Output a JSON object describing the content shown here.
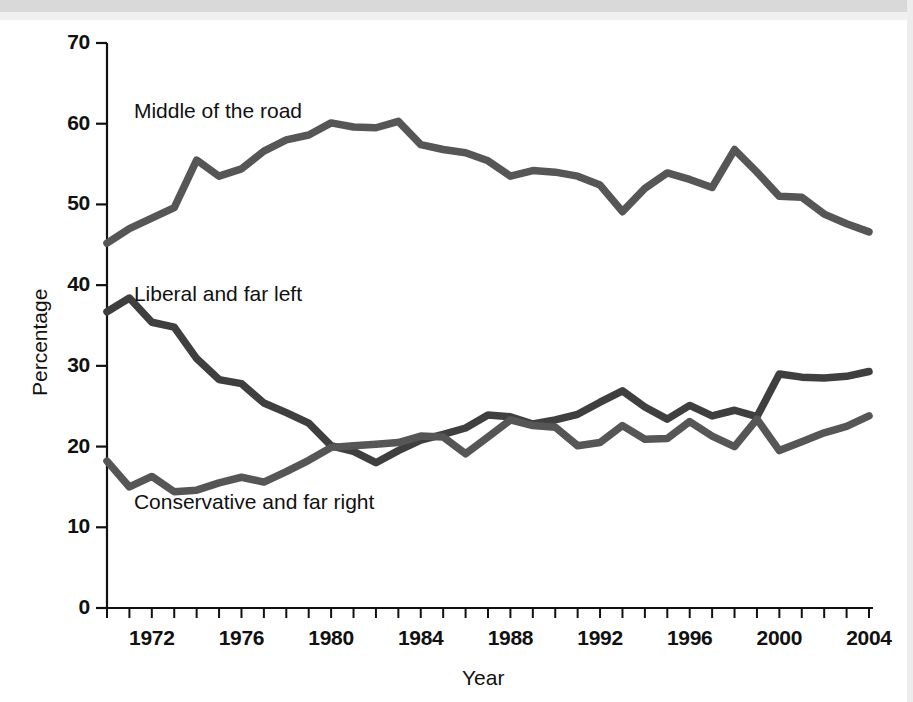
{
  "chart_data": {
    "type": "line",
    "title": "",
    "xlabel": "Year",
    "ylabel": "Percentage",
    "xlim": [
      1970,
      2004
    ],
    "ylim": [
      0,
      70
    ],
    "grid": false,
    "legend_position": "inline-annotations",
    "x_tick_labels": [
      "1972",
      "1976",
      "1980",
      "1984",
      "1988",
      "1992",
      "1996",
      "2000",
      "2004"
    ],
    "x_tick_values": [
      1972,
      1976,
      1980,
      1984,
      1988,
      1992,
      1996,
      2000,
      2004
    ],
    "x_minor_tick_values": [
      1970,
      1971,
      1972,
      1973,
      1974,
      1975,
      1976,
      1977,
      1978,
      1979,
      1980,
      1981,
      1982,
      1983,
      1984,
      1985,
      1986,
      1987,
      1988,
      1989,
      1990,
      1991,
      1992,
      1993,
      1994,
      1995,
      1996,
      1997,
      1998,
      1999,
      2000,
      2001,
      2002,
      2003,
      2004
    ],
    "y_tick_labels": [
      "0",
      "10",
      "20",
      "30",
      "40",
      "50",
      "60",
      "70"
    ],
    "y_tick_values": [
      0,
      10,
      20,
      30,
      40,
      50,
      60,
      70
    ],
    "x": [
      1970,
      1971,
      1972,
      1973,
      1974,
      1975,
      1976,
      1977,
      1978,
      1979,
      1980,
      1981,
      1982,
      1983,
      1984,
      1985,
      1986,
      1987,
      1988,
      1989,
      1990,
      1991,
      1992,
      1993,
      1994,
      1995,
      1996,
      1997,
      1998,
      1999,
      2000,
      2001,
      2002,
      2003,
      2004
    ],
    "series": [
      {
        "name": "Middle of the road",
        "label": "Middle of the road",
        "color": "#565656",
        "values": [
          45.2,
          47.0,
          48.3,
          49.6,
          55.5,
          53.5,
          54.4,
          56.6,
          58.0,
          58.6,
          60.1,
          59.6,
          59.5,
          60.3,
          57.4,
          56.8,
          56.4,
          55.4,
          53.5,
          54.2,
          54.0,
          53.5,
          52.4,
          49.1,
          52.0,
          53.9,
          53.1,
          52.1,
          56.8,
          54.0,
          51.0,
          50.9,
          48.8,
          47.6,
          46.6
        ]
      },
      {
        "name": "Liberal and far left",
        "label": "Liberal and far left",
        "color": "#3f3f3f",
        "values": [
          36.7,
          38.4,
          35.4,
          34.8,
          30.9,
          28.3,
          27.8,
          25.4,
          24.2,
          22.9,
          20.1,
          19.4,
          18.0,
          19.5,
          20.8,
          21.5,
          22.3,
          23.9,
          23.7,
          22.8,
          23.3,
          24.0,
          25.5,
          26.9,
          24.9,
          23.4,
          25.1,
          23.8,
          24.5,
          23.7,
          29.0,
          28.6,
          28.5,
          28.7,
          29.3
        ]
      },
      {
        "name": "Conservative and far right",
        "label": "Conservative and far right",
        "color": "#565656",
        "values": [
          18.2,
          15.0,
          16.3,
          14.4,
          14.6,
          15.5,
          16.2,
          15.6,
          16.9,
          18.3,
          19.9,
          20.1,
          20.3,
          20.5,
          21.3,
          21.2,
          19.1,
          21.2,
          23.3,
          22.6,
          22.4,
          20.1,
          20.5,
          22.6,
          20.9,
          21.0,
          23.1,
          21.3,
          20.0,
          23.4,
          19.5,
          20.6,
          21.7,
          22.5,
          23.8
        ]
      }
    ],
    "annotations": [
      {
        "text": "Middle of the road",
        "x": 1971.2,
        "y": 61.5
      },
      {
        "text": "Liberal and far left",
        "x": 1971.2,
        "y": 38.8
      },
      {
        "text": "Conservative and far right",
        "x": 1971.2,
        "y": 13.0
      }
    ]
  }
}
